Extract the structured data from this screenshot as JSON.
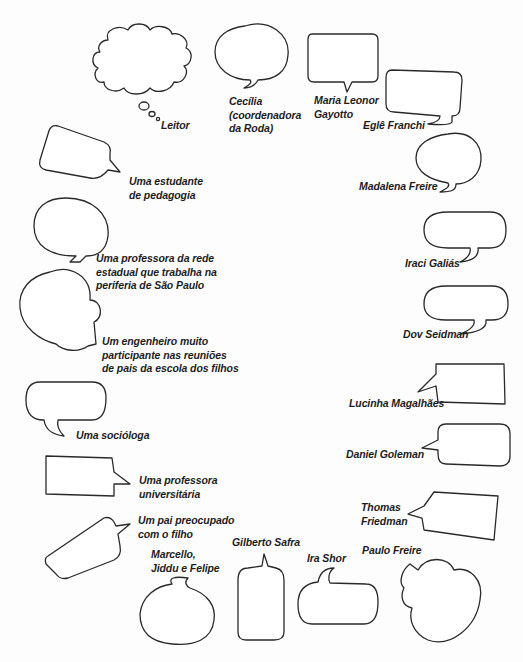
{
  "figure": {
    "type": "speech-bubble-circle",
    "bubbles": [
      {
        "id": "leitor",
        "label": "Leitor",
        "shape": "thought-cloud"
      },
      {
        "id": "cecilia",
        "label": "Cecília\n(coordenadora\nda Roda)",
        "shape": "oval-speech"
      },
      {
        "id": "maria-leonor",
        "label": "Maria Leonor\nGayotto",
        "shape": "rounded-rect-speech"
      },
      {
        "id": "egle",
        "label": "Eglê Franchi",
        "shape": "rounded-rect-speech"
      },
      {
        "id": "madalena",
        "label": "Madalena Freire",
        "shape": "oval-speech"
      },
      {
        "id": "iraci",
        "label": "Iraci Galiás",
        "shape": "rounded-speech"
      },
      {
        "id": "dov",
        "label": "Dov Seidman",
        "shape": "rounded-speech"
      },
      {
        "id": "lucinha",
        "label": "Lucinha Magalhães",
        "shape": "rect-speech"
      },
      {
        "id": "goleman",
        "label": "Daniel Goleman",
        "shape": "rounded-rect-speech"
      },
      {
        "id": "friedman",
        "label": "Thomas\nFriedman",
        "shape": "rect-speech"
      },
      {
        "id": "paulo-freire",
        "label": "Paulo Freire",
        "shape": "cloud-speech"
      },
      {
        "id": "ira-shor",
        "label": "Ira Shor",
        "shape": "rounded-speech"
      },
      {
        "id": "gilberto",
        "label": "Gilberto Safra",
        "shape": "tall-rounded-speech"
      },
      {
        "id": "marcello",
        "label": "Marcello,\nJiddu e Felipe",
        "shape": "round-speech"
      },
      {
        "id": "pai",
        "label": "Um pai preocupado\ncom o filho",
        "shape": "tilted-rect-speech"
      },
      {
        "id": "prof-univ",
        "label": "Uma professora\nuniversitária",
        "shape": "rect-speech"
      },
      {
        "id": "sociologa",
        "label": "Uma socióloga",
        "shape": "rounded-speech"
      },
      {
        "id": "engenheiro",
        "label": "Um engenheiro muito\nparticipante nas reuniões\nde pais da escola dos filhos",
        "shape": "cloud-speech"
      },
      {
        "id": "prof-rede",
        "label": "Uma professora da rede\nestadual que trabalha na\nperiferia de São Paulo",
        "shape": "oval-speech"
      },
      {
        "id": "estudante",
        "label": "Uma estudante\nde pedagogia",
        "shape": "tilted-rect-speech"
      }
    ]
  }
}
